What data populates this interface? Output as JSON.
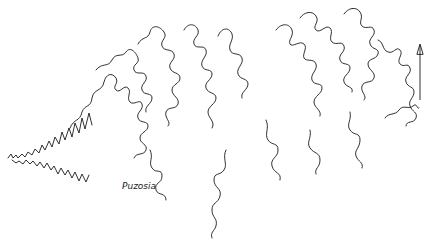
{
  "figure": {
    "label": "Puzosia",
    "arrow_direction": "up",
    "line_color": "#1a1a1a",
    "background": "#ffffff"
  }
}
